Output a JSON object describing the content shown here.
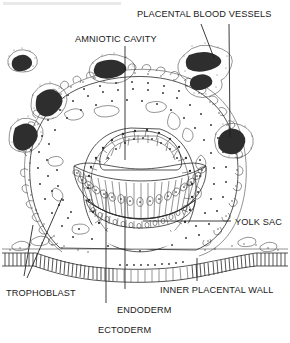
{
  "figure": {
    "background_color": "#ffffff",
    "ink_color": "#1a1a1a",
    "vessel_color": "#2e2e2e"
  },
  "labels": {
    "placental_blood_vessels": "PLACENTAL BLOOD VESSELS",
    "amniotic_cavity": "AMNIOTIC CAVITY",
    "yolk_sac": "YOLK SAC",
    "trophoblast": "TROPHOBLAST",
    "endoderm": "ENDODERM",
    "ectoderm": "ECTODERM",
    "inner_placental_wall": "INNER PLACENTAL WALL",
    "cut_off_header": ""
  },
  "structures": [
    {
      "name": "amniotic-cavity",
      "label": "AMNIOTIC CAVITY",
      "description": "Clear cavity above the embryonic disc"
    },
    {
      "name": "ectoderm",
      "label": "ECTODERM",
      "description": "Radially arranged columnar cells of the embryonic disc"
    },
    {
      "name": "endoderm",
      "label": "ENDODERM",
      "description": "Cell layer lining the roof of the yolk sac"
    },
    {
      "name": "yolk-sac",
      "label": "YOLK SAC",
      "description": "Large rounded cavity below the embryonic disc"
    },
    {
      "name": "trophoblast",
      "label": "TROPHOBLAST",
      "description": "Stippled outer tissue surrounding the embryo"
    },
    {
      "name": "placental-blood-vessels",
      "label": "PLACENTAL BLOOD VESSELS",
      "description": "Dark maternal blood vessel profiles in placental tissue"
    },
    {
      "name": "inner-placental-wall",
      "label": "INNER PLACENTAL WALL",
      "description": "Hatched columnar epithelial layer across the bottom"
    }
  ]
}
